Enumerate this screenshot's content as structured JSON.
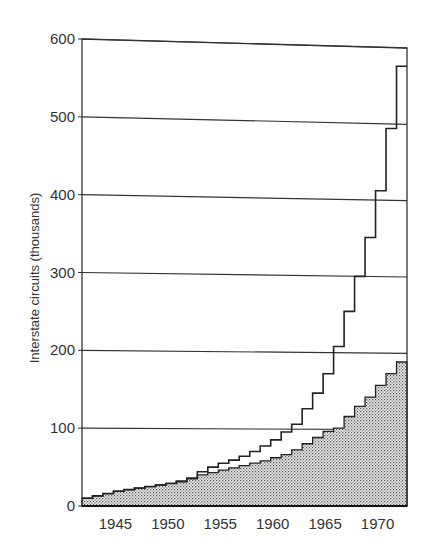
{
  "chart_data": {
    "type": "line",
    "subtype": "step",
    "title": "",
    "xlabel": "",
    "ylabel": "Interstate circuits (thousands)",
    "xlim": [
      1942,
      1973
    ],
    "ylim": [
      0,
      600
    ],
    "yticks": [
      0,
      100,
      200,
      300,
      400,
      500,
      600
    ],
    "xticks": [
      1945,
      1950,
      1955,
      1960,
      1965,
      1970
    ],
    "grid": {
      "horizontal": true,
      "vertical": false
    },
    "legend": null,
    "x": [
      1942,
      1943,
      1944,
      1945,
      1946,
      1947,
      1948,
      1949,
      1950,
      1951,
      1952,
      1953,
      1954,
      1955,
      1956,
      1957,
      1958,
      1959,
      1960,
      1961,
      1962,
      1963,
      1964,
      1965,
      1966,
      1967,
      1968,
      1969,
      1970,
      1971,
      1972
    ],
    "series": [
      {
        "name": "Total interstate circuits",
        "style": "step-line",
        "values": [
          10,
          13,
          16,
          19,
          21,
          23,
          25,
          27,
          29,
          32,
          36,
          44,
          50,
          55,
          59,
          64,
          70,
          77,
          85,
          95,
          105,
          125,
          145,
          170,
          205,
          250,
          295,
          345,
          405,
          485,
          565
        ]
      },
      {
        "name": "Shaded portion",
        "style": "step-area-stippled",
        "values": [
          10,
          13,
          16,
          19,
          21,
          23,
          25,
          27,
          29,
          31,
          35,
          40,
          43,
          46,
          49,
          52,
          55,
          58,
          62,
          66,
          72,
          80,
          88,
          96,
          100,
          115,
          128,
          140,
          155,
          170,
          185
        ]
      }
    ],
    "annotations": []
  },
  "axes": {
    "y_title": "Interstate circuits (thousands)",
    "y_tick_labels": [
      "0",
      "100",
      "200",
      "300",
      "400",
      "500",
      "600"
    ],
    "x_tick_labels": [
      "1945",
      "1950",
      "1955",
      "1960",
      "1965",
      "1970"
    ]
  }
}
